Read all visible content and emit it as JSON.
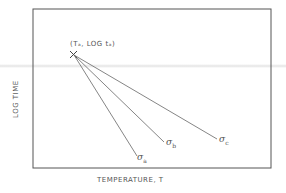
{
  "diagram": {
    "type": "line-schematic",
    "axes": {
      "xlabel": "TEMPERATURE, T",
      "ylabel": "LOG TIME"
    },
    "origin_point": {
      "label": "(Tₐ, LOG tₐ)",
      "label_text": "(Ta, LOG ta)",
      "marker": "x-marker"
    },
    "lines": [
      {
        "name": "sigma_a",
        "symbol": "σ",
        "subscript": "a"
      },
      {
        "name": "sigma_b",
        "symbol": "σ",
        "subscript": "b"
      },
      {
        "name": "sigma_c",
        "symbol": "σ",
        "subscript": "c"
      }
    ],
    "colors": {
      "line": "#666666",
      "frame": "#555555",
      "text": "#555555"
    }
  }
}
